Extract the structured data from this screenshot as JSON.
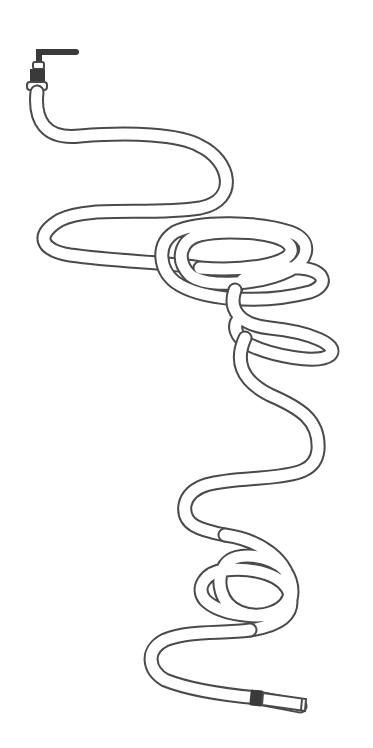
{
  "scene": {
    "description": "Pencil line drawing of a long tangled garden hose attached to a faucet",
    "background": "#ffffff",
    "ink_color": "#4a4a4a",
    "dark_fill": "#3a3a3a"
  },
  "elements": {
    "faucet": "faucet attached at top-left",
    "hose": "coiled garden hose with tangled loops",
    "nozzle": "hose end fitting at bottom-right"
  }
}
